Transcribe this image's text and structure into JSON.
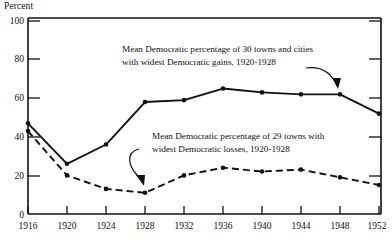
{
  "chart_data": {
    "type": "line",
    "title": "",
    "xlabel": "",
    "ylabel": "Percent",
    "x": [
      1916,
      1920,
      1924,
      1928,
      1932,
      1936,
      1940,
      1944,
      1948,
      1952
    ],
    "xtick_labels": [
      "1916",
      "1920",
      "1924",
      "1928",
      "1932",
      "1936",
      "1940",
      "1944",
      "1948",
      "1952"
    ],
    "ytick_labels": [
      "0",
      "20",
      "40",
      "60",
      "80",
      "100"
    ],
    "yticks": [
      0,
      20,
      40,
      60,
      80,
      100
    ],
    "ylim": [
      0,
      100
    ],
    "xlim": [
      1916,
      1952
    ],
    "grid": false,
    "legend_position": "inline-annotations",
    "series": [
      {
        "name": "Mean Democratic percentage of 30 towns and cities with widest Democratic gains, 1920-1928",
        "style": "solid",
        "marker": "dot",
        "color": "#111111",
        "values": [
          47,
          26,
          36,
          58,
          59,
          65,
          63,
          62,
          62,
          52
        ]
      },
      {
        "name": "Mean Democratic percentage of 29 towns with widest Democratic losses, 1920-1928",
        "style": "dashed",
        "marker": "dot",
        "color": "#111111",
        "values": [
          43,
          20,
          13,
          11,
          20,
          24,
          22,
          23,
          19,
          15
        ]
      }
    ],
    "annotations": [
      {
        "id": "annotation-gains",
        "line1": "Mean Democratic percentage of 30 towns and cities",
        "line2": "with widest Democratic gains, 1920-1928",
        "points_to_year": 1948,
        "points_to_value": 62
      },
      {
        "id": "annotation-losses",
        "line1": "Mean Democratic percentage of 29 towns with",
        "line2": "widest Democratic losses, 1920-1928",
        "points_to_year": 1928,
        "points_to_value": 11
      }
    ]
  },
  "axis": {
    "ylabel": "Percent",
    "ytick_0": "0",
    "ytick_20": "20",
    "ytick_40": "40",
    "ytick_60": "60",
    "ytick_80": "80",
    "ytick_100": "100",
    "xtick_1916": "1916",
    "xtick_1920": "1920",
    "xtick_1924": "1924",
    "xtick_1928": "1928",
    "xtick_1932": "1932",
    "xtick_1936": "1936",
    "xtick_1940": "1940",
    "xtick_1944": "1944",
    "xtick_1948": "1948",
    "xtick_1952": "1952"
  },
  "annotations": {
    "gains_line1": "Mean Democratic percentage of 30 towns and cities",
    "gains_line2": "with widest Democratic gains, 1920-1928",
    "losses_line1": "Mean Democratic percentage of 29 towns with",
    "losses_line2": "widest Democratic losses, 1920-1928"
  }
}
